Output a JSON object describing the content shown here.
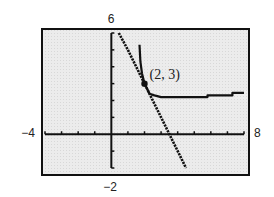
{
  "chart_data": {
    "type": "line",
    "title": "",
    "xlabel": "",
    "ylabel": "",
    "xlim": [
      -4,
      8
    ],
    "ylim": [
      -2,
      6
    ],
    "window_labels": {
      "xmin": "−4",
      "xmax": "8",
      "ymin": "−2",
      "ymax": "6"
    },
    "grid": false,
    "x_ticks": [
      -3,
      -2,
      -1,
      1,
      2,
      3,
      4,
      5,
      6,
      7
    ],
    "y_ticks": [
      -1,
      1,
      2,
      3,
      4,
      5
    ],
    "series": [
      {
        "name": "line",
        "style": "dotted-dark",
        "points": [
          [
            0.45,
            6
          ],
          [
            1,
            5
          ],
          [
            2,
            3
          ],
          [
            3,
            1
          ],
          [
            3.5,
            0
          ],
          [
            4,
            -1
          ],
          [
            4.5,
            -2
          ]
        ]
      },
      {
        "name": "curve",
        "style": "solid-dark",
        "points": [
          [
            1.7,
            5.3
          ],
          [
            1.75,
            4.3
          ],
          [
            1.85,
            3.6
          ],
          [
            2,
            3
          ],
          [
            2.3,
            2.4
          ],
          [
            2.6,
            2.3
          ],
          [
            3,
            2.2
          ],
          [
            5.8,
            2.2
          ],
          [
            5.8,
            2.3
          ],
          [
            7.3,
            2.3
          ],
          [
            7.3,
            2.45
          ],
          [
            8,
            2.45
          ]
        ]
      }
    ],
    "annotations": [
      {
        "text": "(2, 3)",
        "x": 2,
        "y": 3,
        "marker": "filled-circle"
      }
    ],
    "background": "#e8e8e8",
    "frame_color": "#111111",
    "line_color": "#111111"
  }
}
